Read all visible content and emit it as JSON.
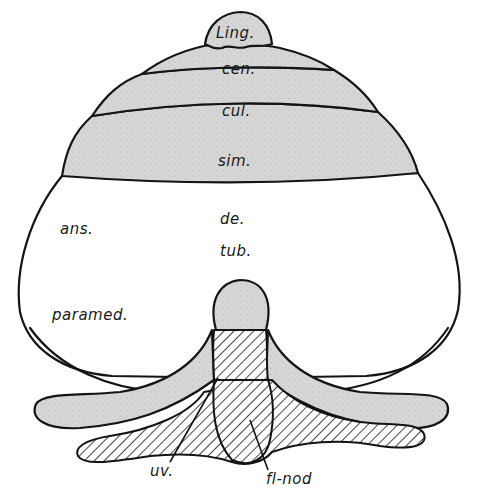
{
  "figure": {
    "type": "anatomical diagram",
    "colors": {
      "stipple_fill": "#d6d6d6",
      "outline": "#141414",
      "background": "#ffffff"
    },
    "labels": {
      "lingula": "Ling.",
      "central": "cen.",
      "culmen": "cul.",
      "simplex": "sim.",
      "ansiform": "ans.",
      "declive": "de.",
      "tuber": "tub.",
      "paramedian": "paramed.",
      "uvula": "uv.",
      "flocculonodular": "fl-nod"
    },
    "regions": [
      {
        "name": "lingula",
        "fill": "stippled"
      },
      {
        "name": "central",
        "fill": "stippled"
      },
      {
        "name": "culmen",
        "fill": "stippled"
      },
      {
        "name": "simplex",
        "fill": "stippled"
      },
      {
        "name": "ansiform/paramedian hemisphere",
        "fill": "white"
      },
      {
        "name": "pyramis",
        "fill": "stippled"
      },
      {
        "name": "uvula",
        "fill": "hatched"
      },
      {
        "name": "paraflocculus wings",
        "fill": "stippled"
      },
      {
        "name": "flocculonodular lobe",
        "fill": "hatched"
      }
    ]
  }
}
